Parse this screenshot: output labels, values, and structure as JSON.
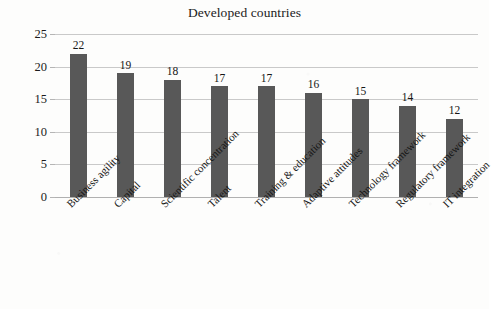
{
  "chart_data": {
    "type": "bar",
    "title": "Developed countries",
    "xlabel": "",
    "ylabel": "",
    "ylim": [
      0,
      25
    ],
    "ytick_labels": [
      "0",
      "5",
      "10",
      "15",
      "20",
      "25"
    ],
    "yticks": [
      0,
      5,
      10,
      15,
      20,
      25
    ],
    "grid": true,
    "legend": "none",
    "bar_color": "#585858",
    "gridline_color": "#c9c9c9",
    "categories": [
      "Business agility",
      "Capital",
      "Scientific concentration",
      "Talent",
      "Training & education",
      "Adaptive attitudes",
      "Technology framework",
      "Regulatory framework",
      "IT integration"
    ],
    "values": [
      22,
      19,
      18,
      17,
      17,
      16,
      15,
      14,
      12
    ],
    "data_labels": [
      "22",
      "19",
      "18",
      "17",
      "17",
      "16",
      "15",
      "14",
      "12"
    ]
  }
}
